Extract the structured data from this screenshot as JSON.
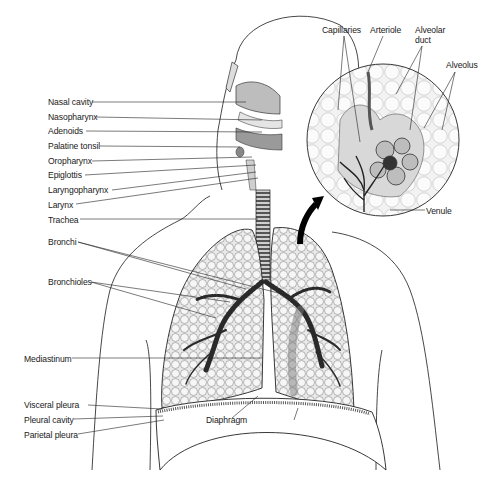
{
  "labels_left": [
    {
      "id": "nasal-cavity",
      "text": "Nasal cavity",
      "x": 48,
      "y": 97
    },
    {
      "id": "nasopharynx",
      "text": "Nasopharynx",
      "x": 48,
      "y": 112
    },
    {
      "id": "adenoids",
      "text": "Adenoids",
      "x": 48,
      "y": 126
    },
    {
      "id": "palatine-tonsil",
      "text": "Palatine tonsil",
      "x": 48,
      "y": 141
    },
    {
      "id": "oropharynx",
      "text": "Oropharynx",
      "x": 48,
      "y": 156
    },
    {
      "id": "epiglottis",
      "text": "Epiglottis",
      "x": 48,
      "y": 170
    },
    {
      "id": "laryngopharynx",
      "text": "Laryngopharynx",
      "x": 48,
      "y": 185
    },
    {
      "id": "larynx",
      "text": "Larynx",
      "x": 48,
      "y": 200
    },
    {
      "id": "trachea",
      "text": "Trachea",
      "x": 48,
      "y": 215
    },
    {
      "id": "bronchi",
      "text": "Bronchi",
      "x": 48,
      "y": 237
    },
    {
      "id": "bronchioles",
      "text": "Bronchioles",
      "x": 48,
      "y": 277
    },
    {
      "id": "mediastinum",
      "text": "Mediastinum",
      "x": 24,
      "y": 354
    },
    {
      "id": "visceral-pleura",
      "text": "Visceral pleura",
      "x": 24,
      "y": 400
    },
    {
      "id": "pleural-cavity",
      "text": "Pleural cavity",
      "x": 24,
      "y": 415
    },
    {
      "id": "parietal-pleura",
      "text": "Parietal pleura",
      "x": 24,
      "y": 430
    }
  ],
  "labels_inset": [
    {
      "id": "capillaries",
      "text": "Capillaries",
      "x": 322,
      "y": 25
    },
    {
      "id": "arteriole",
      "text": "Arteriole",
      "x": 370,
      "y": 25
    },
    {
      "id": "alveolar-duct",
      "text": "Alveolar\nduct",
      "x": 415,
      "y": 25
    },
    {
      "id": "alveolus",
      "text": "Alveolus",
      "x": 446,
      "y": 60
    },
    {
      "id": "venule",
      "text": "Venule",
      "x": 426,
      "y": 206
    }
  ],
  "labels_other": [
    {
      "id": "diaphragm",
      "text": "Diaphragm",
      "x": 206,
      "y": 415
    }
  ],
  "colors": {
    "ink": "#1a1a1a",
    "lung_fill": "#e6e6e6",
    "inset_bg": "#f3f3f3",
    "arrow": "#000000"
  }
}
